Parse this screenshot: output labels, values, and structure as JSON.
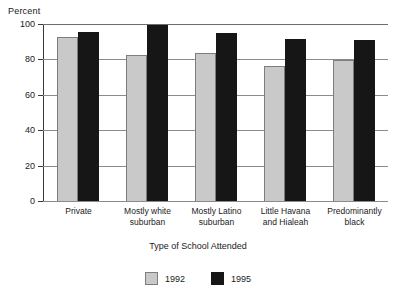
{
  "chart_data": {
    "type": "bar",
    "title": "",
    "xlabel": "Type of School Attended",
    "ylabel": "Percent",
    "ylim": [
      0,
      100
    ],
    "yticks": [
      0,
      20,
      40,
      60,
      80,
      100
    ],
    "ytick_labels": [
      "0",
      "20",
      "40",
      "60",
      "80",
      "100"
    ],
    "grid": true,
    "legend_position": "bottom-center",
    "categories": [
      "Private",
      "Mostly white suburban",
      "Mostly Latino suburban",
      "Little Havana and Hialeah",
      "Predominantly black"
    ],
    "category_lines": [
      [
        "Private"
      ],
      [
        "Mostly white",
        "suburban"
      ],
      [
        "Mostly Latino",
        "suburban"
      ],
      [
        "Little Havana",
        "and Hialeah"
      ],
      [
        "Predominantly",
        "black"
      ]
    ],
    "series": [
      {
        "name": "1992",
        "color": "#c9c9c9",
        "values": [
          93,
          83,
          84,
          76.5,
          80
        ]
      },
      {
        "name": "1995",
        "color": "#161616",
        "values": [
          96,
          100,
          95.5,
          92,
          91.5
        ]
      }
    ]
  }
}
